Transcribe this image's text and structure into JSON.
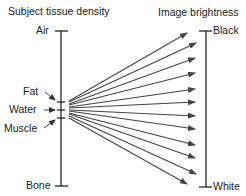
{
  "left_axis": {
    "title": "Subject tissue density",
    "top_label": "Air",
    "bottom_label": "Bone",
    "markers": [
      {
        "label": "Fat"
      },
      {
        "label": "Water"
      },
      {
        "label": "Muscle"
      }
    ]
  },
  "right_axis": {
    "title": "Image brightness",
    "top_label": "Black",
    "bottom_label": "White"
  },
  "arrows": {
    "count": 12,
    "color": "#444444"
  }
}
